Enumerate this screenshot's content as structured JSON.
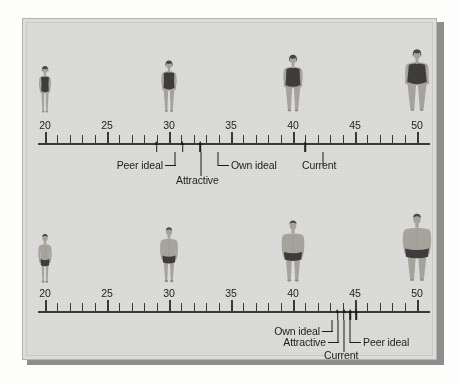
{
  "figure": {
    "colors": {
      "plate_background": "#dddddb",
      "plate_border": "#b4b4ae",
      "plate_shadow": "#8e8e8e",
      "ink": "#1d1d1b",
      "skin": "#a8a59e",
      "skin_shade": "#93908a",
      "garment": "#3f3d3b",
      "hair": "#4a4744",
      "page_background": "#fdfdfb"
    }
  },
  "chart_data": {
    "type": "scatter",
    "xlabel": "",
    "ylabel": "",
    "xlim": [
      18,
      52
    ],
    "grid": false,
    "legend": "none",
    "panels": [
      {
        "id": "female",
        "name": "Female silhouette scale",
        "axis": {
          "min": 20,
          "max": 50,
          "major_step": 5,
          "minor_step": 1,
          "tick_labels": [
            "20",
            "25",
            "30",
            "35",
            "40",
            "45",
            "50"
          ],
          "tick_values": [
            20,
            25,
            30,
            35,
            40,
            45,
            50
          ]
        },
        "silhouettes": [
          {
            "index": 1,
            "value": 20,
            "size": "thin"
          },
          {
            "index": 2,
            "value": 30,
            "size": "average"
          },
          {
            "index": 3,
            "value": 40,
            "size": "heavy"
          },
          {
            "index": 4,
            "value": 50,
            "size": "heaviest"
          }
        ],
        "markers": [
          {
            "label": "Peer ideal",
            "value": 29.0
          },
          {
            "label": "Attractive",
            "value": 31.1
          },
          {
            "label": "Own ideal",
            "value": 32.5
          },
          {
            "label": "Current",
            "value": 41.0
          }
        ]
      },
      {
        "id": "male",
        "name": "Male silhouette scale",
        "axis": {
          "min": 20,
          "max": 50,
          "major_step": 5,
          "minor_step": 1,
          "tick_labels": [
            "20",
            "25",
            "30",
            "35",
            "40",
            "45",
            "50"
          ],
          "tick_values": [
            20,
            25,
            30,
            35,
            40,
            45,
            50
          ]
        },
        "silhouettes": [
          {
            "index": 1,
            "value": 20,
            "size": "thin"
          },
          {
            "index": 2,
            "value": 30,
            "size": "average"
          },
          {
            "index": 3,
            "value": 40,
            "size": "heavy"
          },
          {
            "index": 4,
            "value": 50,
            "size": "heaviest"
          }
        ],
        "markers": [
          {
            "label": "Own ideal",
            "value": 43.6
          },
          {
            "label": "Attractive",
            "value": 44.1
          },
          {
            "label": "Current",
            "value": 44.6
          },
          {
            "label": "Peer ideal",
            "value": 45.1
          }
        ]
      }
    ]
  },
  "female": {
    "ticks": [
      {
        "label": "20",
        "value": 20
      },
      {
        "label": "25",
        "value": 25
      },
      {
        "label": "30",
        "value": 30
      },
      {
        "label": "35",
        "value": 35
      },
      {
        "label": "40",
        "value": 40
      },
      {
        "label": "45",
        "value": 45
      },
      {
        "label": "50",
        "value": 50
      }
    ],
    "callouts": {
      "peer_ideal": "Peer ideal",
      "attractive": "Attractive",
      "own_ideal": "Own ideal",
      "current": "Current"
    }
  },
  "male": {
    "ticks": [
      {
        "label": "20",
        "value": 20
      },
      {
        "label": "25",
        "value": 25
      },
      {
        "label": "30",
        "value": 30
      },
      {
        "label": "35",
        "value": 35
      },
      {
        "label": "40",
        "value": 40
      },
      {
        "label": "45",
        "value": 45
      },
      {
        "label": "50",
        "value": 50
      }
    ],
    "callouts": {
      "own_ideal": "Own ideal",
      "attractive": "Attractive",
      "current": "Current",
      "peer_ideal": "Peer ideal"
    }
  }
}
